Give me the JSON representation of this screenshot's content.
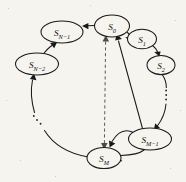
{
  "figure": {
    "background_color": "#f6f4ef",
    "ink_color": "#1a1a1a",
    "dashed_color": "#5a5a5a"
  },
  "nodes": [
    {
      "id": "S0",
      "base": "S",
      "sub": "0",
      "label": "S0",
      "cx": 112,
      "cy": 26,
      "rx": 17.5,
      "ry": 11.0
    },
    {
      "id": "S1",
      "base": "S",
      "sub": "1",
      "label": "S1",
      "cx": 142,
      "cy": 39,
      "rx": 14.5,
      "ry": 9.8
    },
    {
      "id": "S2",
      "base": "S",
      "sub": "2",
      "label": "S2",
      "cx": 161,
      "cy": 65,
      "rx": 14.0,
      "ry": 9.6
    },
    {
      "id": "SM1",
      "base": "S",
      "sub": "M−1",
      "label": "SM−1",
      "cx": 150,
      "cy": 139,
      "rx": 21.5,
      "ry": 11.0
    },
    {
      "id": "SM",
      "base": "S",
      "sub": "M",
      "label": "SM",
      "cx": 104,
      "cy": 158,
      "rx": 17.0,
      "ry": 10.6
    },
    {
      "id": "SN2",
      "base": "S",
      "sub": "N−2",
      "label": "SN−2",
      "cx": 37,
      "cy": 64,
      "rx": 21.5,
      "ry": 11.0
    },
    {
      "id": "SN1",
      "base": "S",
      "sub": "N−1",
      "label": "SN−1",
      "cx": 62,
      "cy": 32,
      "rx": 21.0,
      "ry": 11.0
    }
  ],
  "edges": [
    {
      "id": "s0-to-sn1",
      "from": "S0",
      "to": "SN1",
      "style": "solid",
      "direction": "forward"
    },
    {
      "id": "sn1-from-sn2",
      "from": "SN2",
      "to": "SN1",
      "style": "solid",
      "direction": "forward"
    },
    {
      "id": "sn2-from-arc",
      "from": "SM",
      "to": "SN2",
      "style": "solid",
      "direction": "forward"
    },
    {
      "id": "s0-to-s1",
      "from": "S0",
      "to": "S1",
      "style": "solid",
      "direction": "forward"
    },
    {
      "id": "s1-to-s2",
      "from": "S1",
      "to": "S2",
      "style": "solid",
      "direction": "forward"
    },
    {
      "id": "s2-to-sm1",
      "from": "S2",
      "to": "SM1",
      "style": "solid",
      "direction": "forward"
    },
    {
      "id": "sm1-to-s0",
      "from": "SM1",
      "to": "S0",
      "style": "solid",
      "direction": "forward"
    },
    {
      "id": "s0-sm-dashed",
      "from": "S0",
      "to": "SM",
      "style": "dashed",
      "direction": "both"
    },
    {
      "id": "sm1-to-sm",
      "from": "SM1",
      "to": "SM",
      "style": "solid",
      "direction": "forward"
    },
    {
      "id": "sm-to-sm1",
      "from": "SM",
      "to": "SM1",
      "style": "solid",
      "direction": "forward"
    }
  ],
  "ellipses_marks": [
    {
      "id": "ellipsis-right",
      "orientation": "vertical",
      "dots": 3,
      "x": 166,
      "y": 95
    },
    {
      "id": "ellipsis-left",
      "orientation": "diagonal",
      "dots": 3,
      "x": 38,
      "y": 122
    }
  ]
}
